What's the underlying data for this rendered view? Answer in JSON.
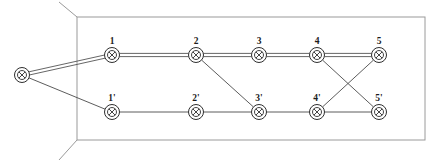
{
  "diagram": {
    "canvas": {
      "width": 436,
      "height": 165
    },
    "colors": {
      "frame": "#9a9a9a",
      "edge": "#4a4a4a",
      "node_stroke": "#2e2e2e",
      "node_fill": "#ffffff",
      "label": "#1c1c1c",
      "background": "#ffffff"
    },
    "frame": {
      "rect": {
        "x": 77,
        "y": 17,
        "width": 348,
        "height": 123
      },
      "corner_ticks": [
        {
          "name": "top-left-tick",
          "x1": 77,
          "y1": 17,
          "x2": 59,
          "y2": 2
        },
        {
          "name": "bottom-left-tick",
          "x1": 77,
          "y1": 140,
          "x2": 59,
          "y2": 160
        }
      ]
    },
    "nodes": [
      {
        "id": "S",
        "label": "",
        "x": 22,
        "y": 75,
        "row": "external"
      },
      {
        "id": "n1",
        "label": "1",
        "x": 112,
        "y": 55,
        "row": "top"
      },
      {
        "id": "n2",
        "label": "2",
        "x": 196,
        "y": 55,
        "row": "top"
      },
      {
        "id": "n3",
        "label": "3",
        "x": 259,
        "y": 55,
        "row": "top"
      },
      {
        "id": "n4",
        "label": "4",
        "x": 317,
        "y": 55,
        "row": "top"
      },
      {
        "id": "n5",
        "label": "5",
        "x": 379,
        "y": 55,
        "row": "top"
      },
      {
        "id": "p1",
        "label": "1'",
        "x": 112,
        "y": 112,
        "row": "bottom"
      },
      {
        "id": "p2",
        "label": "2'",
        "x": 196,
        "y": 112,
        "row": "bottom"
      },
      {
        "id": "p3",
        "label": "3'",
        "x": 259,
        "y": 112,
        "row": "bottom"
      },
      {
        "id": "p4",
        "label": "4'",
        "x": 317,
        "y": 112,
        "row": "bottom"
      },
      {
        "id": "p5",
        "label": "5'",
        "x": 379,
        "y": 112,
        "row": "bottom"
      }
    ],
    "node_style": {
      "outer_radius": 7.5,
      "inner_radius": 4.5,
      "cross_radius": 4.5
    },
    "edges": [
      {
        "from": "S",
        "to": "n1",
        "style": "double"
      },
      {
        "from": "S",
        "to": "p1",
        "style": "single"
      },
      {
        "from": "n1",
        "to": "n2",
        "style": "double"
      },
      {
        "from": "n2",
        "to": "n3",
        "style": "double"
      },
      {
        "from": "n3",
        "to": "n4",
        "style": "double"
      },
      {
        "from": "n4",
        "to": "n5",
        "style": "double"
      },
      {
        "from": "p1",
        "to": "p2",
        "style": "single"
      },
      {
        "from": "p2",
        "to": "p3",
        "style": "single"
      },
      {
        "from": "p3",
        "to": "p4",
        "style": "single"
      },
      {
        "from": "p4",
        "to": "p5",
        "style": "single"
      },
      {
        "from": "n2",
        "to": "p3",
        "style": "single"
      },
      {
        "from": "n4",
        "to": "p5",
        "style": "single"
      },
      {
        "from": "p4",
        "to": "n5",
        "style": "single"
      }
    ],
    "label_offset_y": -11
  }
}
